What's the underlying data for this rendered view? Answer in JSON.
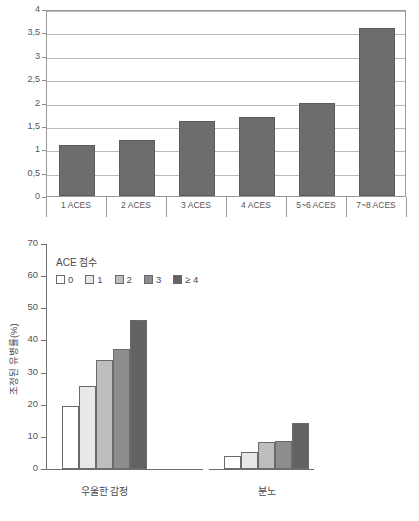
{
  "chart_data": [
    {
      "type": "bar",
      "id": "aces-odds-chart",
      "title": "",
      "xlabel": "",
      "ylabel": "",
      "categories": [
        "1 ACES",
        "2 ACES",
        "3 ACES",
        "4 ACES",
        "5~6 ACES",
        "7~8 ACES"
      ],
      "values": [
        1.1,
        1.2,
        1.6,
        1.7,
        2.0,
        3.6
      ],
      "ylim": [
        0,
        4
      ],
      "yticks": [
        0,
        0.5,
        1,
        1.5,
        2,
        2.5,
        3,
        3.5,
        4
      ],
      "ytick_labels": [
        "0",
        "0,5",
        "1",
        "1,5",
        "2",
        "2,5",
        "3",
        "3,5",
        "4"
      ],
      "grid": true,
      "legend": false,
      "bar_color": "#6d6d6d"
    },
    {
      "type": "bar",
      "id": "ace-prevalence-chart",
      "title": "",
      "xlabel": "",
      "ylabel": "조정된 유병률(%)",
      "categories": [
        "우울한 감정",
        "분노"
      ],
      "ylim": [
        0,
        70
      ],
      "yticks": [
        0,
        10,
        20,
        30,
        40,
        50,
        60,
        70
      ],
      "ytick_labels": [
        "0",
        "10",
        "20",
        "30",
        "40",
        "50",
        "60",
        "70"
      ],
      "grid": false,
      "legend_title": "ACE 점수",
      "legend_position": "top-left",
      "series": [
        {
          "name": "0",
          "values": [
            19.5,
            3.9
          ],
          "color": "#ffffff"
        },
        {
          "name": "1",
          "values": [
            25.8,
            5.2
          ],
          "color": "#e8e8e8"
        },
        {
          "name": "2",
          "values": [
            34.0,
            8.3
          ],
          "color": "#bdbdbd"
        },
        {
          "name": "3",
          "values": [
            37.4,
            8.8
          ],
          "color": "#8d8d8d"
        },
        {
          "name": "≥ 4",
          "values": [
            46.3,
            14.2
          ],
          "color": "#636363"
        }
      ]
    }
  ]
}
